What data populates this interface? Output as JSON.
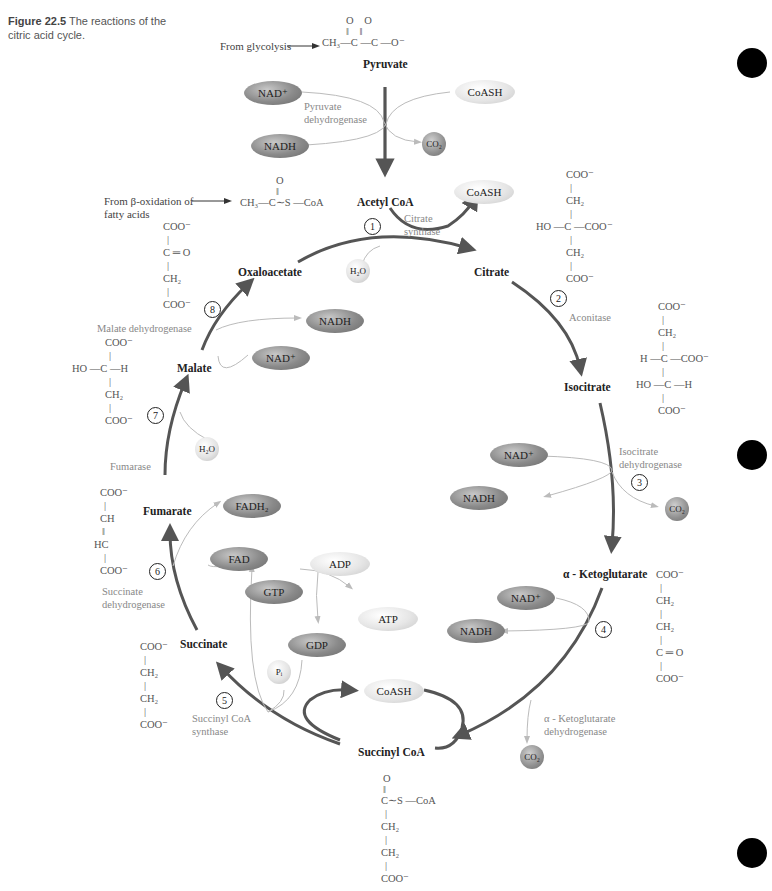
{
  "caption": {
    "figure_label": "Figure 22.5",
    "text": "The reactions of the citric acid cycle."
  },
  "inputs": {
    "from_glycolysis": "From glycolysis",
    "from_beta_oxidation_line1": "From β-oxidation of",
    "from_beta_oxidation_line2": "fatty acids"
  },
  "compounds": {
    "pyruvate": "Pyruvate",
    "acetyl_coa": "Acetyl CoA",
    "citrate": "Citrate",
    "isocitrate": "Isocitrate",
    "alpha_ketoglutarate": "α - Ketoglutarate",
    "succinyl_coa": "Succinyl CoA",
    "succinate": "Succinate",
    "fumarate": "Fumarate",
    "malate": "Malate",
    "oxaloacetate": "Oxaloacetate"
  },
  "enzymes": {
    "pyruvate_dh_1": "Pyruvate",
    "pyruvate_dh_2": "dehydrogenase",
    "citrate_synthase_1": "Citrate",
    "citrate_synthase_2": "synthase",
    "aconitase": "Aconitase",
    "isocitrate_dh_1": "Isocitrate",
    "isocitrate_dh_2": "dehydrogenase",
    "akg_dh_1": "α - Ketoglutarate",
    "akg_dh_2": "dehydrogenase",
    "succinyl_coa_synthase_1": "Succinyl CoA",
    "succinyl_coa_synthase_2": "synthase",
    "succinate_dh_1": "Succinate",
    "succinate_dh_2": "dehydrogenase",
    "fumarase": "Fumarase",
    "malate_dh": "Malate dehydrogenase"
  },
  "steps": [
    "1",
    "2",
    "3",
    "4",
    "5",
    "6",
    "7",
    "8"
  ],
  "cofactors": {
    "pdh_nad": "NAD⁺",
    "pdh_nadh": "NADH",
    "pdh_coash": "CoASH",
    "pdh_co2": "CO₂",
    "cs_coash": "CoASH",
    "cs_h2o": "H₂O",
    "idh_nad": "NAD⁺",
    "idh_nadh": "NADH",
    "idh_co2": "CO₂",
    "akg_nad": "NAD⁺",
    "akg_nadh": "NADH",
    "akg_co2": "CO₂",
    "scs_coash": "CoASH",
    "scs_gtp": "GTP",
    "scs_gdp": "GDP",
    "scs_pi": "Pᵢ",
    "scs_adp": "ADP",
    "scs_atp": "ATP",
    "sdh_fad": "FAD",
    "sdh_fadh2": "FADH₂",
    "fum_h2o": "H₂O",
    "mdh_nad": "NAD⁺",
    "mdh_nadh": "NADH"
  },
  "structures": {
    "pyruvate": {
      "top": "O      O",
      "bonds": "‖      ‖",
      "main": "CH₃—C —C —O⁻"
    },
    "acetyl_coa": {
      "top": "O",
      "bonds": "‖",
      "main": "CH₃—C∼S —CoA"
    },
    "oxaloacetate": [
      "COO⁻",
      "|",
      "C ═ O",
      "|",
      "CH₂",
      "|",
      "COO⁻"
    ],
    "citrate": [
      "COO⁻",
      "|",
      "CH₂",
      "|",
      "HO —C —COO⁻",
      "|",
      "CH₂",
      "|",
      "COO⁻"
    ],
    "isocitrate": [
      "COO⁻",
      "|",
      "CH₂",
      "|",
      "H —C —COO⁻",
      "|",
      "HO —C —H",
      "|",
      "COO⁻"
    ],
    "alpha_ketoglutarate": [
      "COO⁻",
      "|",
      "CH₂",
      "|",
      "CH₂",
      "|",
      "C ═ O",
      "|",
      "COO⁻"
    ],
    "succinyl_coa": [
      "O",
      "‖",
      "C∼S —CoA",
      "|",
      "CH₂",
      "|",
      "CH₂",
      "|",
      "COO⁻"
    ],
    "succinate": [
      "COO⁻",
      "|",
      "CH₂",
      "|",
      "CH₂",
      "|",
      "COO⁻"
    ],
    "fumarate": [
      "COO⁻",
      "|",
      "CH",
      "‖",
      "HC",
      "|",
      "COO⁻"
    ],
    "malate": [
      "COO⁻",
      "|",
      "HO —C —H",
      "|",
      "CH₂",
      "|",
      "COO⁻"
    ]
  },
  "colors": {
    "cycle_arrow": "#555555",
    "side_arrow": "#bbbbbb",
    "dark_ellipse": "#8a8a8a",
    "light_ellipse": "#e6e6e6",
    "page_marker": "#000000"
  }
}
